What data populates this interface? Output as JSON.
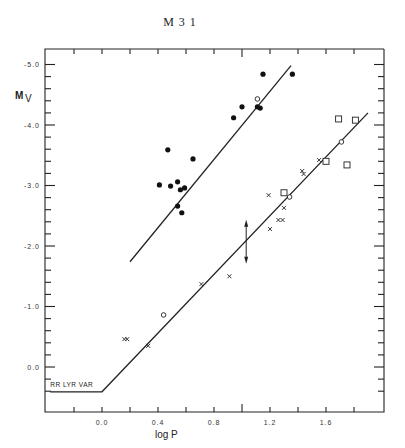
{
  "chart_data": {
    "type": "scatter",
    "title": "M 3 1",
    "xlabel": "log P",
    "ylabel": "M_V",
    "xlim": [
      -0.41,
      2.0
    ],
    "ylim": [
      0.75,
      -5.25
    ],
    "y_inverted": true,
    "grid": false,
    "x_ticks": [
      "0.0",
      "0.4",
      "0.8",
      "1.2",
      "1.6"
    ],
    "x_tick_values": [
      0.0,
      0.4,
      0.8,
      1.2,
      1.6
    ],
    "y_ticks": [
      "-5.0",
      "-4.0",
      "-3.0",
      "-2.0",
      "-1.0",
      "0.0"
    ],
    "y_tick_values": [
      -5.0,
      -4.0,
      -3.0,
      -2.0,
      -1.0,
      0.0
    ],
    "annotations": [
      {
        "text": "RR LYR VAR",
        "x": -0.37,
        "y": 0.33
      },
      {
        "type": "double-arrow",
        "x": 1.03,
        "y_from": -2.4,
        "y_to": -1.74
      }
    ],
    "lines": [
      {
        "name": "upper P-L relation",
        "points": [
          [
            0.2,
            -1.74
          ],
          [
            1.35,
            -4.98
          ]
        ]
      },
      {
        "name": "lower P-L relation",
        "points": [
          [
            -0.37,
            0.41
          ],
          [
            0.0,
            0.41
          ],
          [
            1.9,
            -4.2
          ]
        ]
      }
    ],
    "series": [
      {
        "name": "filled circles",
        "marker": "filled-circle",
        "points": [
          [
            0.47,
            -3.59
          ],
          [
            0.65,
            -3.44
          ],
          [
            0.41,
            -3.01
          ],
          [
            0.49,
            -2.99
          ],
          [
            0.54,
            -3.06
          ],
          [
            0.56,
            -2.93
          ],
          [
            0.59,
            -2.96
          ],
          [
            0.54,
            -2.66
          ],
          [
            0.57,
            -2.55
          ],
          [
            0.94,
            -4.12
          ],
          [
            1.0,
            -4.3
          ],
          [
            1.11,
            -4.3
          ],
          [
            1.13,
            -4.28
          ],
          [
            1.15,
            -4.84
          ],
          [
            1.36,
            -4.84
          ]
        ]
      },
      {
        "name": "open circles",
        "marker": "open-circle",
        "points": [
          [
            1.11,
            -4.43
          ],
          [
            0.44,
            -0.86
          ],
          [
            1.34,
            -2.81
          ],
          [
            1.71,
            -3.72
          ]
        ]
      },
      {
        "name": "crosses",
        "marker": "x",
        "points": [
          [
            0.16,
            -0.46
          ],
          [
            0.18,
            -0.46
          ],
          [
            0.33,
            -0.35
          ],
          [
            0.71,
            -1.37
          ],
          [
            0.91,
            -1.5
          ],
          [
            1.2,
            -2.28
          ],
          [
            1.26,
            -2.43
          ],
          [
            1.29,
            -2.43
          ],
          [
            1.3,
            -2.63
          ],
          [
            1.19,
            -2.84
          ],
          [
            1.43,
            -3.24
          ],
          [
            1.44,
            -3.19
          ],
          [
            1.55,
            -3.42
          ]
        ]
      },
      {
        "name": "open squares",
        "marker": "open-square",
        "points": [
          [
            1.3,
            -2.88
          ],
          [
            1.6,
            -3.4
          ],
          [
            1.69,
            -4.1
          ],
          [
            1.81,
            -4.08
          ],
          [
            1.75,
            -3.34
          ]
        ]
      }
    ]
  }
}
